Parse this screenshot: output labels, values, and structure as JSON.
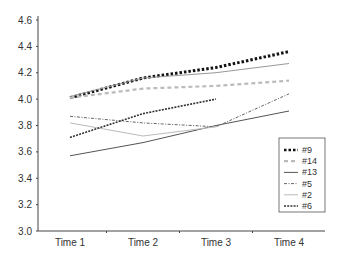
{
  "chart_data": {
    "type": "line",
    "title": "",
    "xlabel": "",
    "ylabel": "",
    "categories": [
      "Time 1",
      "Time 2",
      "Time 3",
      "Time 4"
    ],
    "ylim": [
      3.0,
      4.6
    ],
    "yticks": [
      "3.0",
      "3.2",
      "3.4",
      "3.6",
      "3.8",
      "4.0",
      "4.2",
      "4.4",
      "4.6"
    ],
    "grid": false,
    "legend_position": "lower right, inside plot",
    "series": [
      {
        "name": "#9",
        "style": "heavy-dotted",
        "color": "#111111",
        "values": [
          4.01,
          4.16,
          4.24,
          4.36
        ]
      },
      {
        "name": "#14",
        "style": "dashed",
        "color": "#bbbbbb",
        "values": [
          4.01,
          4.08,
          4.1,
          4.14
        ]
      },
      {
        "name": "#13",
        "style": "solid-thin",
        "color": "#555555",
        "values": [
          3.57,
          3.67,
          3.8,
          3.91
        ]
      },
      {
        "name": "#5",
        "style": "dash-dot",
        "color": "#666666",
        "values": [
          3.87,
          3.82,
          3.79,
          4.04
        ]
      },
      {
        "name": "#2",
        "style": "solid-light",
        "color": "#bbbbbb",
        "values": [
          3.82,
          3.72,
          3.79,
          null
        ]
      },
      {
        "name": "#6",
        "style": "dashed-dark",
        "color": "#333333",
        "values": [
          3.71,
          3.89,
          4.0,
          null
        ]
      },
      {
        "name": "",
        "style": "solid-medium",
        "color": "#999999",
        "values": [
          4.02,
          4.16,
          4.2,
          4.27
        ]
      }
    ]
  }
}
